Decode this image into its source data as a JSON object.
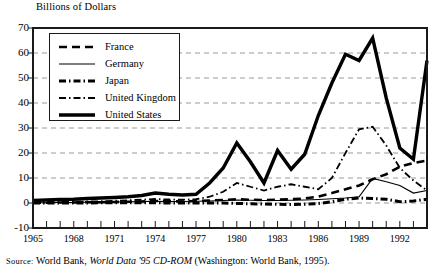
{
  "figure": {
    "axis_title": "Billions of Dollars",
    "source": {
      "label": "Source:",
      "text_before": "World Bank, ",
      "italic_text": "World Data '95 CD-ROM",
      "text_after": " (Washington: World Bank, 1995)."
    }
  },
  "colors": {
    "line": "#000000",
    "grid": "#9a9a9a",
    "frame": "#1a1a1a",
    "background": "#ffffff"
  },
  "chart_data": {
    "type": "line",
    "title": "Billions of Dollars",
    "xlabel": "",
    "ylabel": "Billions of Dollars",
    "ylim": [
      -10,
      70
    ],
    "xlim": [
      1965,
      1994
    ],
    "yticks": [
      70,
      60,
      50,
      40,
      30,
      20,
      10,
      0,
      -10
    ],
    "ytick_labels": [
      "70",
      "60",
      "50",
      "40",
      "30",
      "20",
      "10",
      "0",
      "-10"
    ],
    "xticks": [
      1965,
      1968,
      1971,
      1974,
      1977,
      1980,
      1983,
      1986,
      1989,
      1992
    ],
    "xtick_labels": [
      "1965",
      "1968",
      "1971",
      "1974",
      "1977",
      "1980",
      "1983",
      "1986",
      "1989",
      "1992"
    ],
    "minor_xticks_every": 1,
    "grid": "horizontal-dashed",
    "legend_position": "upper-left",
    "x": [
      1965,
      1966,
      1967,
      1968,
      1969,
      1970,
      1971,
      1972,
      1973,
      1974,
      1975,
      1976,
      1977,
      1978,
      1979,
      1980,
      1981,
      1982,
      1983,
      1984,
      1985,
      1986,
      1987,
      1988,
      1989,
      1990,
      1991,
      1992,
      1993,
      1994
    ],
    "series": [
      {
        "name": "France",
        "style": "dashed",
        "width": 2.6,
        "values": [
          0.1,
          0.1,
          0.2,
          0.2,
          0.3,
          0.3,
          0.4,
          0.5,
          0.6,
          0.8,
          0.7,
          0.6,
          0.8,
          1.0,
          1.2,
          1.5,
          1.3,
          1.2,
          1.3,
          1.5,
          1.8,
          2.6,
          4.0,
          5.5,
          7.0,
          9.5,
          11.5,
          14.5,
          16.0,
          17.0
        ]
      },
      {
        "name": "Germany",
        "style": "solid-thin",
        "width": 1.2,
        "values": [
          0.1,
          0.1,
          0.2,
          0.2,
          0.3,
          0.4,
          0.4,
          0.5,
          0.6,
          0.7,
          0.6,
          0.6,
          0.7,
          0.8,
          1.0,
          1.2,
          1.1,
          1.0,
          1.0,
          1.1,
          1.2,
          1.4,
          1.7,
          2.0,
          2.5,
          9.8,
          8.5,
          7.0,
          4.0,
          5.0
        ]
      },
      {
        "name": "Japan",
        "style": "dash-dot-thick",
        "width": 3.0,
        "values": [
          0.0,
          0.0,
          0.0,
          0.0,
          0.0,
          0.1,
          0.1,
          0.1,
          0.1,
          0.1,
          0.0,
          0.0,
          0.0,
          0.0,
          0.0,
          -0.2,
          -0.3,
          -0.4,
          -0.5,
          -0.6,
          -0.5,
          -0.2,
          0.5,
          1.5,
          2.0,
          1.8,
          1.5,
          0.5,
          0.8,
          1.5
        ]
      },
      {
        "name": "United Kingdom",
        "style": "dash-dot-thin",
        "width": 1.8,
        "values": [
          0.2,
          0.3,
          0.4,
          0.5,
          0.6,
          0.7,
          0.9,
          1.1,
          1.3,
          1.6,
          1.4,
          1.3,
          1.5,
          2.5,
          4.5,
          8.0,
          6.5,
          5.0,
          6.5,
          7.5,
          6.5,
          5.5,
          10.0,
          20.0,
          29.5,
          30.5,
          23.0,
          14.0,
          9.0,
          5.0
        ]
      },
      {
        "name": "United States",
        "style": "solid-thick",
        "width": 3.4,
        "values": [
          1.0,
          1.2,
          1.4,
          1.5,
          1.8,
          2.0,
          2.2,
          2.5,
          3.0,
          4.0,
          3.5,
          3.2,
          3.5,
          8.0,
          14.0,
          24.0,
          16.5,
          8.0,
          21.0,
          13.5,
          19.5,
          35.0,
          48.0,
          59.5,
          57.0,
          66.0,
          42.0,
          22.0,
          17.5,
          57.0
        ]
      }
    ]
  },
  "legend": {
    "entries": [
      {
        "label": "France",
        "style": "dashed"
      },
      {
        "label": "Germany",
        "style": "solid-thin"
      },
      {
        "label": "Japan",
        "style": "dash-dot-thick"
      },
      {
        "label": "United Kingdom",
        "style": "dash-dot-thin"
      },
      {
        "label": "United States",
        "style": "solid-thick"
      }
    ]
  }
}
